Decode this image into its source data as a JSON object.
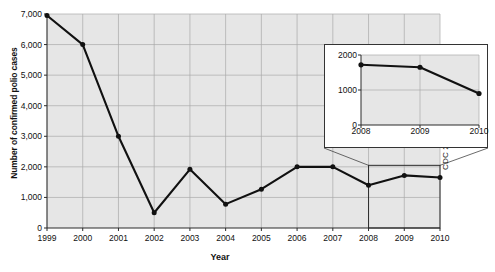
{
  "chart_data": {
    "type": "line",
    "title": "",
    "xlabel": "Year",
    "ylabel": "Number of confirmed polio cases",
    "grid": true,
    "legend": "none",
    "source_note": "CDC 2010.",
    "xlim": [
      1999,
      2010
    ],
    "ylim": [
      0,
      7000
    ],
    "x_ticks": [
      "1999",
      "2000",
      "2001",
      "2002",
      "2003",
      "2004",
      "2005",
      "2006",
      "2007",
      "2008",
      "2009",
      "2010"
    ],
    "y_ticks": [
      "0",
      "1,000",
      "2,000",
      "3,000",
      "4,000",
      "5,000",
      "6,000",
      "7,000"
    ],
    "y_tick_values": [
      0,
      1000,
      2000,
      3000,
      4000,
      5000,
      6000,
      7000
    ],
    "x": [
      1999,
      2000,
      2001,
      2002,
      2003,
      2004,
      2005,
      2006,
      2007,
      2008,
      2009,
      2010
    ],
    "values": [
      6950,
      6000,
      3000,
      500,
      1920,
      780,
      1270,
      2000,
      2000,
      1400,
      1720,
      1650
    ],
    "series": [
      {
        "name": "Confirmed polio cases",
        "values": [
          6950,
          6000,
          3000,
          500,
          1920,
          780,
          1270,
          2000,
          2000,
          1400,
          1720,
          1650
        ]
      }
    ],
    "highlight_region": {
      "x_start": 2008,
      "x_end": 2010,
      "y_start": 0,
      "y_end": 2050,
      "description": "boxed 2008-2010 region magnified in inset"
    },
    "inset": {
      "type": "line",
      "xlabel": "",
      "ylabel": "",
      "xlim": [
        2008,
        2010
      ],
      "ylim": [
        0,
        2000
      ],
      "x_ticks": [
        "2008",
        "2009",
        "2010"
      ],
      "y_ticks": [
        "0",
        "1000",
        "2000"
      ],
      "y_tick_values": [
        0,
        1000,
        2000
      ],
      "x": [
        2008,
        2009,
        2010
      ],
      "values": [
        1720,
        1650,
        900
      ],
      "series": [
        {
          "name": "Confirmed polio cases (detail)",
          "values": [
            1720,
            1650,
            900
          ]
        }
      ]
    }
  },
  "colors": {
    "plot_background": "#e6e6e6",
    "page_background": "#ffffff",
    "grid": "#a9a9a9",
    "axis": "#2b2b2b",
    "line": "#111111",
    "marker": "#111111",
    "inset_border": "#333333"
  }
}
